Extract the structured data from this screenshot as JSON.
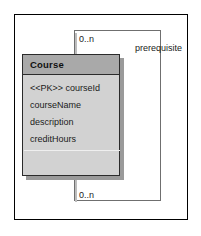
{
  "diagram": {
    "type": "uml-class-diagram",
    "frame": {
      "name": "diagram-frame"
    },
    "class": {
      "name": "Course",
      "attributes": [
        "<<PK>> courseId",
        "courseName",
        "description",
        "creditHours"
      ],
      "operations": []
    },
    "association": {
      "kind": "self-association",
      "role_label": "prerequisite",
      "multiplicity_source": "0..n",
      "multiplicity_target": "0..n"
    },
    "colors": {
      "class_fill": "#d2d2d2",
      "class_header_fill": "#a9a9a9",
      "class_border": "#2b2b2b",
      "shadow": "#9a9a9a",
      "line": "#6f6f6f",
      "frame_border": "#000000",
      "text": "#1a1a1a"
    }
  }
}
